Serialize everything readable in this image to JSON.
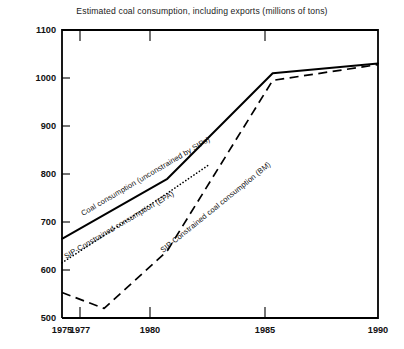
{
  "chart_data": {
    "type": "line",
    "title": "Estimated coal consumption, including exports (millions of tons)",
    "xlabel": "",
    "ylabel": "",
    "xlim": [
      1975,
      1990
    ],
    "ylim": [
      500,
      1100
    ],
    "grid": false,
    "legend_position": "inline-labels",
    "x_ticks": [
      "1975",
      "1977",
      "1980",
      "1985",
      "1990"
    ],
    "x_tick_values": [
      1975,
      1977,
      1980,
      1985,
      1990
    ],
    "y_ticks": [
      "500",
      "600",
      "700",
      "800",
      "900",
      "1000",
      "1100"
    ],
    "y_tick_values": [
      500,
      600,
      700,
      800,
      900,
      1000,
      1100
    ],
    "series": [
      {
        "name": "Coal consumption (unconstrained by SIPs)",
        "style": "solid",
        "x": [
          1975,
          1977,
          1980,
          1985,
          1990
        ],
        "values": [
          665,
          715,
          790,
          1010,
          1030
        ]
      },
      {
        "name": "SIP-Constrained consumption (EPA)",
        "style": "dotted",
        "x": [
          1975,
          1977,
          1980,
          1982
        ],
        "values": [
          615,
          672,
          760,
          820
        ]
      },
      {
        "name": "SIP-Constrained coal consumption (BM)",
        "style": "dashed",
        "x": [
          1975,
          1977,
          1980,
          1985,
          1990
        ],
        "values": [
          553,
          520,
          640,
          995,
          1028
        ]
      }
    ]
  },
  "labels": {
    "series_0": "Coal consumption (unconstrained by SIPs)",
    "series_1": "SIP-Constrained consumption (EPA)",
    "series_2": "SIP-Constrained coal consumption (BM)"
  },
  "axis": {
    "y_500": "500",
    "y_600": "600",
    "y_700": "700",
    "y_800": "800",
    "y_900": "900",
    "y_1000": "1000",
    "y_1100": "1100",
    "x_1975": "1975",
    "x_1977": "1977",
    "x_1980": "1980",
    "x_1985": "1985",
    "x_1990": "1990"
  }
}
